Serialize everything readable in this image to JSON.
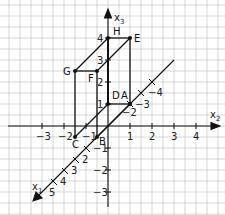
{
  "diagram": {
    "type": "3d-coordinate-system-cuboid",
    "axes": {
      "x1": {
        "label": "x",
        "sub": "1",
        "ticks": [
          "1",
          "2",
          "3",
          "4",
          "5"
        ],
        "negative_ticks": [
          "-1",
          "-2",
          "-3",
          "-4"
        ]
      },
      "x2": {
        "label": "x",
        "sub": "2",
        "ticks": [
          "-3",
          "-2",
          "-1",
          "1",
          "2",
          "3",
          "4"
        ]
      },
      "x3": {
        "label": "x",
        "sub": "3",
        "ticks": [
          "4",
          "3",
          "2",
          "1",
          "-1",
          "-2",
          "-3"
        ]
      }
    },
    "tick_labels": {
      "x2_m3": "−3",
      "x2_m2": "−2",
      "x2_m1": "−1",
      "x2_1": "1",
      "x2_2": "2",
      "x2_3": "3",
      "x2_4": "4",
      "x3_1": "1",
      "x3_2": "2",
      "x3_3": "3",
      "x3_4": "4",
      "x3_m1": "−1",
      "x3_m2": "−2",
      "x3_m3": "−3",
      "x1_2": "2",
      "x1_3": "3",
      "x1_4": "4",
      "x1_5": "5",
      "x1_m2": "−2",
      "x1_m3": "−3",
      "x1_m4": "−4"
    },
    "points": {
      "A": "A",
      "B": "B",
      "C": "C",
      "D": "D",
      "E": "E",
      "F": "F",
      "G": "G",
      "H": "H"
    },
    "colors": {
      "grid": "#b8b8b8",
      "lines": "#111111",
      "background": "#ffffff"
    }
  }
}
